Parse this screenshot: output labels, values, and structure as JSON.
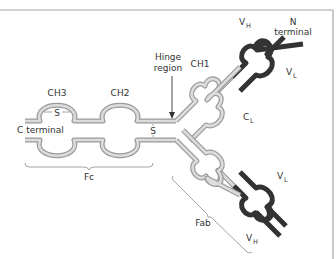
{
  "figure": {
    "labels": {
      "ch3": "CH3",
      "ch2": "CH2",
      "ch1": "CH1",
      "hinge_line1": "Hinge",
      "hinge_line2": "region",
      "c_terminal": "C terminal",
      "n_terminal_line1": "N",
      "n_terminal_line2": "terminal",
      "vh_main": "V",
      "vh_sub": "H",
      "vl_main": "V",
      "vl_sub": "L",
      "cl_main": "C",
      "cl_sub": "L",
      "fc": "Fc",
      "fab": "Fab",
      "disulfide_ch3": "S",
      "disulfide_hinge": "S"
    },
    "colors": {
      "constant_chain": "#c8c8c8",
      "constant_chain_outline": "#9a9a9a",
      "variable_chain": "#333333",
      "text": "#333333",
      "frame": "#a6a6a6",
      "background": "#ffffff"
    }
  }
}
